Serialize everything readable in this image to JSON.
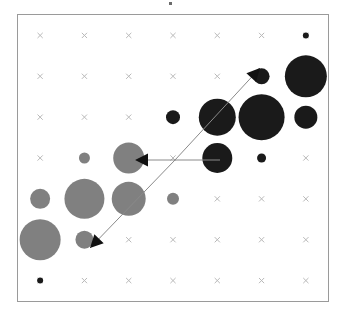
{
  "figure": {
    "title": "",
    "background": "#ffffff",
    "frame_color": "#9a9a9a",
    "marker_color": "#b9b9b9",
    "negative_color": "#808080",
    "positive_color": "#1a1a1a",
    "annotation_line_color": "#8a8a8a",
    "annotation_head_color": "#111111"
  },
  "chart_data": {
    "type": "scatter",
    "title": "",
    "subtitle": "",
    "xlabel": "",
    "ylabel": "",
    "grid": true,
    "legend": "none",
    "xlim": [
      0.5,
      7.5
    ],
    "ylim": [
      0.5,
      7.5
    ],
    "x_tick_labels": [
      "1",
      "2",
      "3",
      "4",
      "5",
      "6",
      "7"
    ],
    "y_tick_labels": [
      "7",
      "6",
      "5",
      "4",
      "3",
      "2",
      "1"
    ],
    "note": "Correlation-matrix style bubble plot: marker area encodes magnitude, fill color encodes sign (gray = negative, black = positive). Background crosses mark every grid cell.",
    "columns": 7,
    "rows": 7,
    "points": [
      {
        "col": 1,
        "row": 1,
        "value": 0.04,
        "sign": "none",
        "radius": 0
      },
      {
        "col": 2,
        "row": 1,
        "value": 0.04,
        "sign": "none",
        "radius": 0
      },
      {
        "col": 3,
        "row": 1,
        "value": 0.04,
        "sign": "none",
        "radius": 0
      },
      {
        "col": 4,
        "row": 1,
        "value": 0.04,
        "sign": "none",
        "radius": 0
      },
      {
        "col": 5,
        "row": 1,
        "value": 0.04,
        "sign": "none",
        "radius": 0
      },
      {
        "col": 6,
        "row": 1,
        "value": 0.04,
        "sign": "none",
        "radius": 0
      },
      {
        "col": 7,
        "row": 1,
        "value": 0.1,
        "sign": "positive",
        "radius": 3.0
      },
      {
        "col": 1,
        "row": 2,
        "value": 0.04,
        "sign": "none",
        "radius": 0
      },
      {
        "col": 2,
        "row": 2,
        "value": 0.04,
        "sign": "none",
        "radius": 0
      },
      {
        "col": 3,
        "row": 2,
        "value": 0.04,
        "sign": "none",
        "radius": 0
      },
      {
        "col": 4,
        "row": 2,
        "value": 0.04,
        "sign": "none",
        "radius": 0
      },
      {
        "col": 5,
        "row": 2,
        "value": 0.05,
        "sign": "none",
        "radius": 0
      },
      {
        "col": 6,
        "row": 2,
        "value": 0.26,
        "sign": "positive",
        "radius": 8.0
      },
      {
        "col": 7,
        "row": 2,
        "value": 0.72,
        "sign": "positive",
        "radius": 21.0
      },
      {
        "col": 1,
        "row": 3,
        "value": 0.04,
        "sign": "none",
        "radius": 0
      },
      {
        "col": 2,
        "row": 3,
        "value": 0.04,
        "sign": "none",
        "radius": 0
      },
      {
        "col": 3,
        "row": 3,
        "value": 0.04,
        "sign": "none",
        "radius": 0
      },
      {
        "col": 4,
        "row": 3,
        "value": 0.23,
        "sign": "positive",
        "radius": 7.0
      },
      {
        "col": 5,
        "row": 3,
        "value": 0.62,
        "sign": "positive",
        "radius": 18.5
      },
      {
        "col": 6,
        "row": 3,
        "value": 0.78,
        "sign": "positive",
        "radius": 23.0
      },
      {
        "col": 7,
        "row": 3,
        "value": 0.38,
        "sign": "positive",
        "radius": 11.5
      },
      {
        "col": 1,
        "row": 4,
        "value": 0.04,
        "sign": "none",
        "radius": 0
      },
      {
        "col": 2,
        "row": 4,
        "value": 0.18,
        "sign": "negative",
        "radius": 5.5
      },
      {
        "col": 3,
        "row": 4,
        "value": 0.52,
        "sign": "negative",
        "radius": 15.5
      },
      {
        "col": 4,
        "row": 4,
        "value": 0.04,
        "sign": "none",
        "radius": 0
      },
      {
        "col": 5,
        "row": 4,
        "value": 0.5,
        "sign": "positive",
        "radius": 15.0
      },
      {
        "col": 6,
        "row": 4,
        "value": 0.15,
        "sign": "positive",
        "radius": 4.5
      },
      {
        "col": 7,
        "row": 4,
        "value": 0.04,
        "sign": "none",
        "radius": 0
      },
      {
        "col": 1,
        "row": 5,
        "value": 0.33,
        "sign": "negative",
        "radius": 10.0
      },
      {
        "col": 2,
        "row": 5,
        "value": 0.67,
        "sign": "negative",
        "radius": 20.0
      },
      {
        "col": 3,
        "row": 5,
        "value": 0.57,
        "sign": "negative",
        "radius": 17.0
      },
      {
        "col": 4,
        "row": 5,
        "value": 0.2,
        "sign": "negative",
        "radius": 6.0
      },
      {
        "col": 5,
        "row": 5,
        "value": 0.04,
        "sign": "none",
        "radius": 0
      },
      {
        "col": 6,
        "row": 5,
        "value": 0.04,
        "sign": "none",
        "radius": 0
      },
      {
        "col": 7,
        "row": 5,
        "value": 0.04,
        "sign": "none",
        "radius": 0
      },
      {
        "col": 1,
        "row": 6,
        "value": 0.7,
        "sign": "negative",
        "radius": 20.5
      },
      {
        "col": 2,
        "row": 6,
        "value": 0.29,
        "sign": "negative",
        "radius": 9.0
      },
      {
        "col": 3,
        "row": 6,
        "value": 0.05,
        "sign": "none",
        "radius": 0
      },
      {
        "col": 4,
        "row": 6,
        "value": 0.04,
        "sign": "none",
        "radius": 0
      },
      {
        "col": 5,
        "row": 6,
        "value": 0.04,
        "sign": "none",
        "radius": 0
      },
      {
        "col": 6,
        "row": 6,
        "value": 0.04,
        "sign": "none",
        "radius": 0
      },
      {
        "col": 7,
        "row": 6,
        "value": 0.04,
        "sign": "none",
        "radius": 0
      },
      {
        "col": 1,
        "row": 7,
        "value": 0.1,
        "sign": "positive",
        "radius": 3.0
      },
      {
        "col": 2,
        "row": 7,
        "value": 0.04,
        "sign": "none",
        "radius": 0
      },
      {
        "col": 3,
        "row": 7,
        "value": 0.04,
        "sign": "none",
        "radius": 0
      },
      {
        "col": 4,
        "row": 7,
        "value": 0.04,
        "sign": "none",
        "radius": 0
      },
      {
        "col": 5,
        "row": 7,
        "value": 0.04,
        "sign": "none",
        "radius": 0
      },
      {
        "col": 6,
        "row": 7,
        "value": 0.04,
        "sign": "none",
        "radius": 0
      },
      {
        "col": 7,
        "row": 7,
        "value": 0.04,
        "sign": "none",
        "radius": 0
      }
    ],
    "annotations": [
      {
        "name": "arrow-up-right",
        "label": "",
        "from": {
          "x": 175,
          "y": 160
        },
        "to": {
          "x": 260,
          "y": 68
        },
        "head_angle_deg": -47
      },
      {
        "name": "arrow-left-horizontal",
        "label": "",
        "from": {
          "x": 220,
          "y": 160
        },
        "to": {
          "x": 135,
          "y": 160
        },
        "head_angle_deg": 180
      },
      {
        "name": "arrow-down-left",
        "label": "",
        "from": {
          "x": 175,
          "y": 160
        },
        "to": {
          "x": 90,
          "y": 248
        },
        "head_angle_deg": 134
      }
    ]
  }
}
